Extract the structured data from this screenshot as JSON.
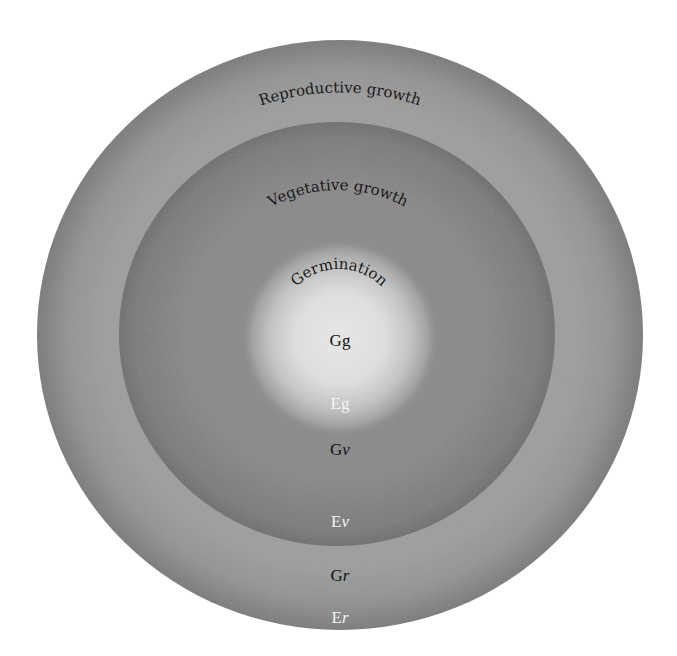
{
  "diagram": {
    "colors": {
      "background": "#ffffff",
      "outer_ring_edge": "#7a7a7a",
      "outer_ring_mid": "#9c9c9c",
      "vegetative_ring_edge": "#6e6e6e",
      "vegetative_ring_mid": "#888888",
      "germination_core": "#e6e6e6",
      "dark_text": "#111111",
      "light_text": "#f4f4f4"
    },
    "stages": [
      {
        "id": "reproductive",
        "label": "Reproductive growth",
        "codes": [
          {
            "prefix": "G",
            "suffix": "r",
            "color": "dark"
          },
          {
            "prefix": "E",
            "suffix": "r",
            "color": "light"
          }
        ]
      },
      {
        "id": "vegetative",
        "label": "Vegetative growth",
        "codes": [
          {
            "prefix": "G",
            "suffix": "ν",
            "color": "dark"
          },
          {
            "prefix": "E",
            "suffix": "ν",
            "color": "light"
          }
        ]
      },
      {
        "id": "germination",
        "label": "Germination",
        "codes": [
          {
            "prefix": "G",
            "suffix": "g",
            "color": "dark"
          },
          {
            "prefix": "E",
            "suffix": "g",
            "color": "light"
          }
        ]
      }
    ]
  }
}
